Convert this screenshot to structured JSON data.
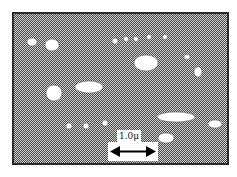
{
  "figure": {
    "type": "micrograph",
    "background_pattern": "checkered-gray",
    "particle_color": "#ffffff",
    "frame_color": "#2a2a2a",
    "scale_bar": {
      "label": "1.0μ",
      "arrow": "double-headed"
    },
    "particles": [
      {
        "cx": 32,
        "cy": 42,
        "rx": 5,
        "ry": 4
      },
      {
        "cx": 52,
        "cy": 45,
        "rx": 7,
        "ry": 6
      },
      {
        "cx": 115,
        "cy": 41,
        "rx": 3,
        "ry": 3
      },
      {
        "cx": 126,
        "cy": 39,
        "rx": 2.5,
        "ry": 2.5
      },
      {
        "cx": 136,
        "cy": 39,
        "rx": 2.5,
        "ry": 2.5
      },
      {
        "cx": 149,
        "cy": 37,
        "rx": 2.5,
        "ry": 2.5
      },
      {
        "cx": 165,
        "cy": 37,
        "rx": 2.5,
        "ry": 2.5
      },
      {
        "cx": 146,
        "cy": 63,
        "rx": 12,
        "ry": 8
      },
      {
        "cx": 187,
        "cy": 57,
        "rx": 3,
        "ry": 2.5
      },
      {
        "cx": 198,
        "cy": 72,
        "rx": 4,
        "ry": 5
      },
      {
        "cx": 89,
        "cy": 87,
        "rx": 14,
        "ry": 6
      },
      {
        "cx": 54,
        "cy": 93,
        "rx": 8,
        "ry": 8
      },
      {
        "cx": 176,
        "cy": 117,
        "rx": 19,
        "ry": 5
      },
      {
        "cx": 215,
        "cy": 124,
        "rx": 7,
        "ry": 4
      },
      {
        "cx": 69,
        "cy": 126,
        "rx": 3,
        "ry": 3
      },
      {
        "cx": 86,
        "cy": 126,
        "rx": 3,
        "ry": 3
      },
      {
        "cx": 105,
        "cy": 123,
        "rx": 3,
        "ry": 3
      },
      {
        "cx": 166,
        "cy": 138,
        "rx": 8,
        "ry": 5
      }
    ]
  }
}
